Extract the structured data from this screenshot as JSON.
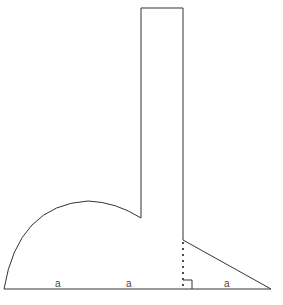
{
  "diagram": {
    "labels": {
      "segment_1": "a",
      "segment_2": "a",
      "segment_3": "a"
    },
    "stroke_color": "#333333",
    "background": "#ffffff",
    "shapes": [
      "semicircular arc on left",
      "tall vertical rectangle",
      "right triangle on right",
      "dotted height line with right-angle marker"
    ]
  }
}
